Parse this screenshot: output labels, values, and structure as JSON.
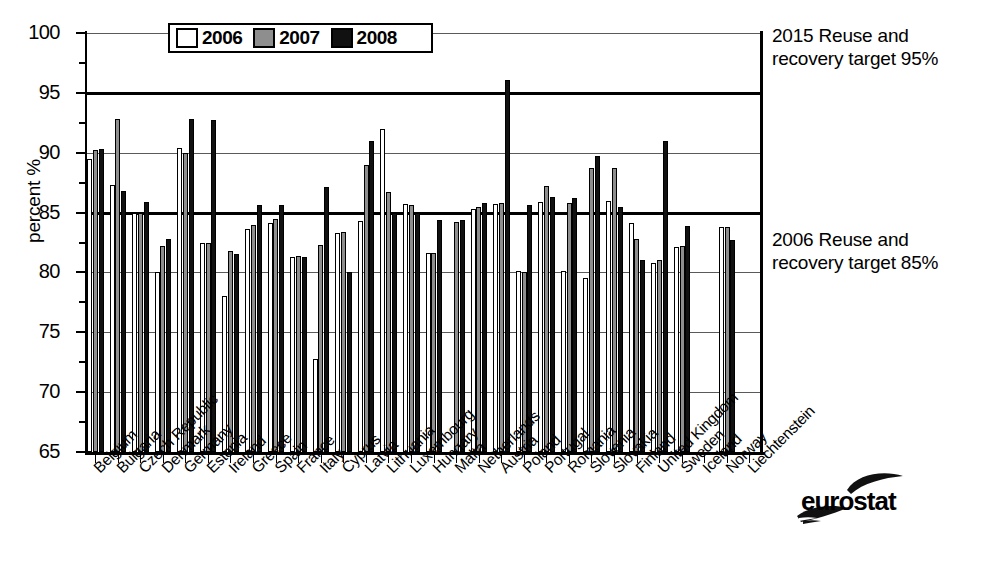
{
  "chart_data": {
    "type": "bar",
    "title": "",
    "xlabel": "",
    "ylabel": "percent %",
    "ylim": [
      65,
      100
    ],
    "yticks": [
      65,
      70,
      75,
      80,
      85,
      90,
      95,
      100
    ],
    "ytick_labels": [
      "65",
      "70",
      "75",
      "80",
      "85",
      "90",
      "95",
      "100"
    ],
    "grid": true,
    "legend_position": "top-center",
    "categories": [
      "Belgium",
      "Bulgaria",
      "Czech Republic",
      "Denmark",
      "Germany",
      "Estonia",
      "Ireland",
      "Greece",
      "Spain",
      "France",
      "Italy",
      "Cyprus",
      "Latvia",
      "Lithuania",
      "Luxembourg",
      "Hungary",
      "Malta",
      "Netherlands",
      "Austria",
      "Poland",
      "Portugal",
      "Romania",
      "Slovenia",
      "Slovakia",
      "Finland",
      "United Kingdom",
      "Sweden",
      "Iceland",
      "Norway",
      "Liechtenstein"
    ],
    "series": [
      {
        "name": "2006",
        "color": "#ffffff",
        "values": [
          89.5,
          87.3,
          85.0,
          80.0,
          90.4,
          82.5,
          78.0,
          83.6,
          84.1,
          81.3,
          72.8,
          83.3,
          84.3,
          92.0,
          85.7,
          81.6,
          null,
          85.3,
          85.7,
          80.1,
          85.9,
          80.1,
          79.5,
          86.0,
          84.1,
          80.8,
          82.1,
          null,
          83.8,
          null
        ]
      },
      {
        "name": "2007",
        "color": "#8e8e8e",
        "values": [
          90.2,
          92.8,
          85.0,
          82.2,
          90.0,
          82.5,
          81.8,
          84.0,
          84.5,
          81.4,
          82.3,
          83.4,
          89.0,
          86.7,
          85.6,
          81.6,
          84.2,
          85.5,
          85.8,
          80.0,
          87.2,
          85.8,
          88.7,
          88.7,
          82.8,
          81.0,
          82.2,
          null,
          83.8,
          null
        ]
      },
      {
        "name": "2008",
        "color": "#111111",
        "values": [
          90.3,
          86.8,
          85.9,
          82.8,
          92.8,
          92.7,
          81.5,
          85.6,
          85.6,
          81.3,
          87.1,
          80.0,
          91.0,
          85.0,
          85.0,
          84.4,
          84.4,
          85.8,
          96.1,
          85.6,
          86.3,
          86.2,
          89.7,
          85.5,
          81.0,
          91.0,
          83.9,
          null,
          82.7,
          null
        ]
      }
    ],
    "reference_lines": [
      {
        "value": 95,
        "label_line1": "2015 Reuse and",
        "label_line2": "recovery target 95%"
      },
      {
        "value": 85,
        "label_line1": "2006 Reuse and",
        "label_line2": "recovery target 85%"
      }
    ]
  },
  "legend": {
    "items": [
      {
        "label": "2006",
        "swatch": "white"
      },
      {
        "label": "2007",
        "swatch": "grey"
      },
      {
        "label": "2008",
        "swatch": "black"
      }
    ]
  },
  "branding": {
    "logo_text": "eurostat",
    "logo_icon": "eurostat-swoosh-icon"
  },
  "colors": {
    "y2006": "#ffffff",
    "y2007": "#8e8e8e",
    "y2008": "#111111",
    "axis": "#000000",
    "grid": "#5a5a5a",
    "background": "#ffffff"
  }
}
